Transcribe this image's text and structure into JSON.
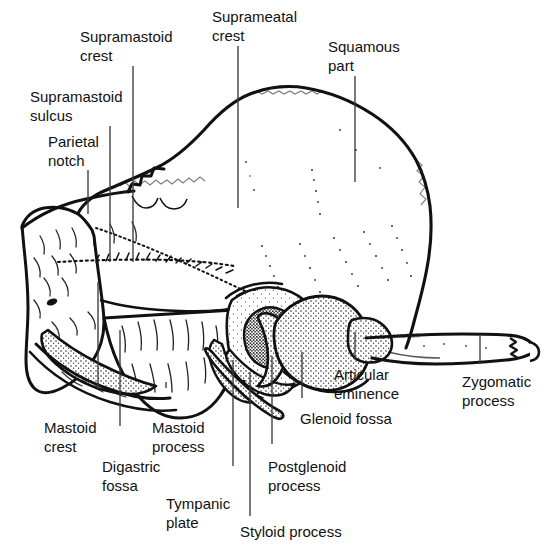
{
  "figure": {
    "artist_signature": "T. CAMERON",
    "ink_color": "#111111",
    "leader_color": "#3a3a3a",
    "background_color": "#ffffff"
  },
  "labels": [
    {
      "id": "supramastoid-crest",
      "lines": [
        "Supramastoid",
        "crest"
      ],
      "x": 80,
      "y": 28,
      "align": "left"
    },
    {
      "id": "suprameatal-crest",
      "lines": [
        "Suprameatal",
        "crest"
      ],
      "x": 212,
      "y": 8,
      "align": "left"
    },
    {
      "id": "squamous-part",
      "lines": [
        "Squamous",
        "part"
      ],
      "x": 328,
      "y": 38,
      "align": "left"
    },
    {
      "id": "supramastoid-sulcus",
      "lines": [
        "Supramastoid",
        "sulcus"
      ],
      "x": 30,
      "y": 88,
      "align": "left"
    },
    {
      "id": "parietal-notch",
      "lines": [
        "Parietal",
        "notch"
      ],
      "x": 48,
      "y": 133,
      "align": "left"
    },
    {
      "id": "mastoid-crest",
      "lines": [
        "Mastoid",
        "crest"
      ],
      "x": 44,
      "y": 419,
      "align": "left"
    },
    {
      "id": "digastric-fossa",
      "lines": [
        "Digastric",
        "fossa"
      ],
      "x": 102,
      "y": 458,
      "align": "left"
    },
    {
      "id": "mastoid-process",
      "lines": [
        "Mastoid",
        "process"
      ],
      "x": 152,
      "y": 419,
      "align": "left"
    },
    {
      "id": "tympanic-plate",
      "lines": [
        "Tympanic",
        "plate"
      ],
      "x": 166,
      "y": 495,
      "align": "left"
    },
    {
      "id": "styloid-process",
      "lines": [
        "Styloid process"
      ],
      "x": 240,
      "y": 523,
      "align": "left"
    },
    {
      "id": "postglenoid-process",
      "lines": [
        "Postglenoid",
        "process"
      ],
      "x": 268,
      "y": 458,
      "align": "left"
    },
    {
      "id": "glenoid-fossa",
      "lines": [
        "Glenoid fossa"
      ],
      "x": 300,
      "y": 410,
      "align": "left"
    },
    {
      "id": "articular-eminence",
      "lines": [
        "Articular",
        "eminence"
      ],
      "x": 334,
      "y": 366,
      "align": "left"
    },
    {
      "id": "zygomatic-process",
      "lines": [
        "Zygomatic",
        "process"
      ],
      "x": 462,
      "y": 373,
      "align": "left"
    }
  ],
  "leaders": [
    {
      "id": "leader-supramastoid-crest",
      "x1": 133,
      "y1": 66,
      "x2": 133,
      "y2": 262
    },
    {
      "id": "leader-suprameatal-crest",
      "x1": 238,
      "y1": 46,
      "x2": 238,
      "y2": 208
    },
    {
      "id": "leader-squamous-part",
      "x1": 355,
      "y1": 76,
      "x2": 355,
      "y2": 182
    },
    {
      "id": "leader-supramastoid-sulcus",
      "x1": 110,
      "y1": 126,
      "x2": 110,
      "y2": 262
    },
    {
      "id": "leader-parietal-notch",
      "x1": 88,
      "y1": 170,
      "x2": 88,
      "y2": 214
    },
    {
      "id": "leader-mastoid-crest",
      "x1": 98,
      "y1": 388,
      "x2": 98,
      "y2": 282
    },
    {
      "id": "leader-digastric-fossa",
      "x1": 120,
      "y1": 426,
      "x2": 120,
      "y2": 330
    },
    {
      "id": "leader-mastoid-process",
      "x1": 166,
      "y1": 388,
      "x2": 166,
      "y2": 382
    },
    {
      "id": "leader-tympanic-plate",
      "x1": 233,
      "y1": 466,
      "x2": 233,
      "y2": 360
    },
    {
      "id": "leader-styloid-process",
      "x1": 250,
      "y1": 516,
      "x2": 250,
      "y2": 372
    },
    {
      "id": "leader-postglenoid-process",
      "x1": 272,
      "y1": 444,
      "x2": 272,
      "y2": 356
    },
    {
      "id": "leader-glenoid-fossa",
      "x1": 302,
      "y1": 398,
      "x2": 302,
      "y2": 352
    },
    {
      "id": "leader-articular-eminence",
      "x1": 355,
      "y1": 360,
      "x2": 355,
      "y2": 332
    },
    {
      "id": "leader-zygomatic-process",
      "x1": 480,
      "y1": 364,
      "x2": 480,
      "y2": 334
    }
  ],
  "structures": [
    {
      "id": "squamous-part",
      "name": "Squamous part"
    },
    {
      "id": "mastoid-portion",
      "name": "Mastoid portion"
    },
    {
      "id": "external-acoustic-meatus",
      "name": "External acoustic meatus"
    },
    {
      "id": "glenoid-fossa",
      "name": "Glenoid (mandibular) fossa"
    },
    {
      "id": "articular-eminence",
      "name": "Articular eminence"
    },
    {
      "id": "zygomatic-process",
      "name": "Zygomatic process"
    },
    {
      "id": "styloid-process",
      "name": "Styloid process"
    },
    {
      "id": "tympanic-plate",
      "name": "Tympanic plate"
    },
    {
      "id": "digastric-fossa",
      "name": "Digastric fossa"
    },
    {
      "id": "parietal-notch",
      "name": "Parietal notch"
    }
  ]
}
